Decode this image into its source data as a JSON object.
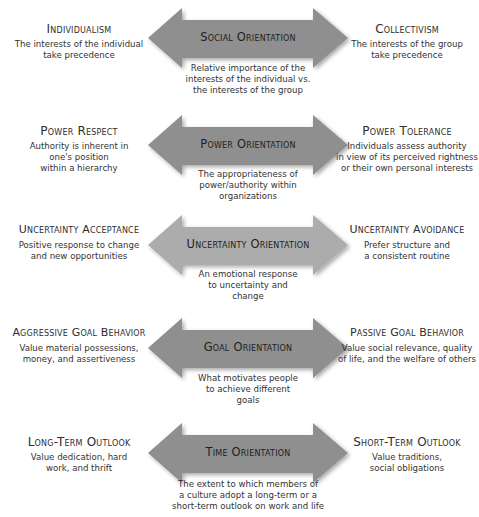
{
  "colors": {
    "arrow_dark": "#8f8f8f",
    "arrow_light": "#acacac",
    "text": "#2a2a2a",
    "background": "#ffffff"
  },
  "rows": [
    {
      "center_title": "Social Orientation",
      "center_desc": "Relative importance of the\ninterests of the individual vs.\nthe interests of the group",
      "left_title": "Individualism",
      "left_desc": "The interests of the individual\ntake precedence",
      "right_title": "Collectivism",
      "right_desc": "The interests of the group\ntake precedence",
      "arrow_icon": "double-headed-arrow"
    },
    {
      "center_title": "Power Orientation",
      "center_desc": "The appropriateness of\npower/authority within\norganizations",
      "left_title": "Power Respect",
      "left_desc": "Authority is inherent in\none's position\nwithin a hierarchy",
      "right_title": "Power Tolerance",
      "right_desc": "Individuals assess authority\nin view of its perceived rightness\nor their own personal interests",
      "arrow_icon": "double-headed-arrow"
    },
    {
      "center_title": "Uncertainty Orientation",
      "center_desc": "An emotional response\nto uncertainty and\nchange",
      "left_title": "Uncertainty Acceptance",
      "left_desc": "Positive response to change\nand new opportunities",
      "right_title": "Uncertainty Avoidance",
      "right_desc": "Prefer structure and\na consistent routine",
      "arrow_icon": "double-headed-arrow"
    },
    {
      "center_title": "Goal Orientation",
      "center_desc": "What motivates people\nto achieve different\ngoals",
      "left_title": "Aggressive Goal Behavior",
      "left_desc": "Value material possessions,\nmoney, and assertiveness",
      "right_title": "Passive Goal Behavior",
      "right_desc": "Value social relevance, quality\nof life, and the welfare of others",
      "arrow_icon": "double-headed-arrow"
    },
    {
      "center_title": "Time Orientation",
      "center_desc": "The extent to which members of\na culture adopt a long-term or a\nshort-term outlook on work and life",
      "left_title": "Long-Term Outlook",
      "left_desc": "Value dedication, hard\nwork, and thrift",
      "right_title": "Short-Term Outlook",
      "right_desc": "Value traditions,\nsocial obligations",
      "arrow_icon": "double-headed-arrow"
    }
  ]
}
